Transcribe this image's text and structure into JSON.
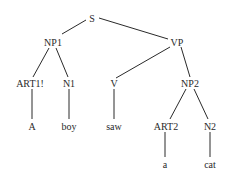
{
  "diagram": {
    "type": "parse-tree",
    "nodes": [
      {
        "id": "S",
        "label": "S",
        "x": 92,
        "y": 18
      },
      {
        "id": "NP1",
        "label": "NP1",
        "x": 53,
        "y": 42
      },
      {
        "id": "VP",
        "label": "VP",
        "x": 177,
        "y": 42
      },
      {
        "id": "ART1",
        "label": "ART1!",
        "x": 30,
        "y": 83
      },
      {
        "id": "N1",
        "label": "N1",
        "x": 69,
        "y": 83
      },
      {
        "id": "V",
        "label": "V",
        "x": 114,
        "y": 83
      },
      {
        "id": "NP2",
        "label": "NP2",
        "x": 190,
        "y": 83
      },
      {
        "id": "A",
        "label": "A",
        "x": 32,
        "y": 126
      },
      {
        "id": "boy",
        "label": "boy",
        "x": 69,
        "y": 126
      },
      {
        "id": "saw",
        "label": "saw",
        "x": 114,
        "y": 126
      },
      {
        "id": "ART2",
        "label": "ART2",
        "x": 166,
        "y": 126
      },
      {
        "id": "N2",
        "label": "N2",
        "x": 210,
        "y": 126
      },
      {
        "id": "a",
        "label": "a",
        "x": 165,
        "y": 164
      },
      {
        "id": "cat",
        "label": "cat",
        "x": 210,
        "y": 164
      }
    ],
    "edges": [
      {
        "from": "S",
        "to": "NP1",
        "x1": 86,
        "y1": 20,
        "x2": 62,
        "y2": 34
      },
      {
        "from": "S",
        "to": "VP",
        "x1": 99,
        "y1": 18,
        "x2": 168,
        "y2": 39
      },
      {
        "from": "NP1",
        "to": "ART1",
        "x1": 49,
        "y1": 48,
        "x2": 33,
        "y2": 77
      },
      {
        "from": "NP1",
        "to": "N1",
        "x1": 56,
        "y1": 48,
        "x2": 68,
        "y2": 77
      },
      {
        "from": "VP",
        "to": "V",
        "x1": 170,
        "y1": 47,
        "x2": 116,
        "y2": 78
      },
      {
        "from": "VP",
        "to": "NP2",
        "x1": 181,
        "y1": 47,
        "x2": 190,
        "y2": 77
      },
      {
        "from": "ART1",
        "to": "A",
        "x1": 32,
        "y1": 89,
        "x2": 32,
        "y2": 119
      },
      {
        "from": "N1",
        "to": "boy",
        "x1": 69,
        "y1": 89,
        "x2": 69,
        "y2": 119
      },
      {
        "from": "V",
        "to": "saw",
        "x1": 114,
        "y1": 89,
        "x2": 114,
        "y2": 119
      },
      {
        "from": "NP2",
        "to": "ART2",
        "x1": 186,
        "y1": 89,
        "x2": 170,
        "y2": 119
      },
      {
        "from": "NP2",
        "to": "N2",
        "x1": 194,
        "y1": 89,
        "x2": 208,
        "y2": 119
      },
      {
        "from": "ART2",
        "to": "a",
        "x1": 165,
        "y1": 132,
        "x2": 165,
        "y2": 157
      },
      {
        "from": "N2",
        "to": "cat",
        "x1": 210,
        "y1": 132,
        "x2": 210,
        "y2": 157
      }
    ]
  },
  "colors": {
    "background": "#ffffff",
    "ink": "#2a2a2a"
  }
}
